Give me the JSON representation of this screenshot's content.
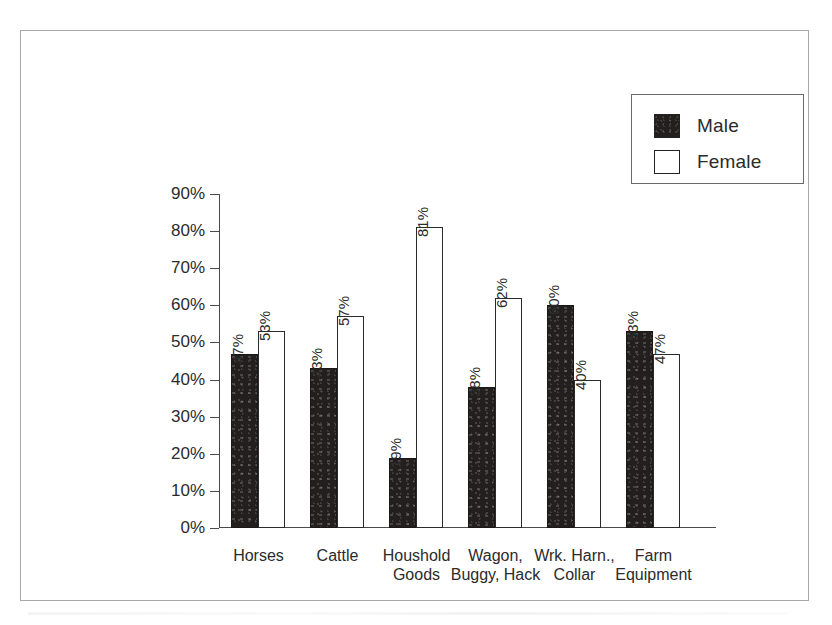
{
  "chart_data": {
    "type": "bar",
    "title": "",
    "subtitle": "",
    "xlabel": "",
    "ylabel": "",
    "ylim": [
      0,
      90
    ],
    "ytick_labels": [
      "90%",
      "80%",
      "70%",
      "60%",
      "50%",
      "40%",
      "30%",
      "20%",
      "10%",
      "0%"
    ],
    "ytick_values": [
      90,
      80,
      70,
      60,
      50,
      40,
      30,
      20,
      10,
      0
    ],
    "grid": false,
    "legend_position": "top-right",
    "categories": [
      "Horses",
      "Cattle",
      "Houshold Goods",
      "Wagon, Buggy, Hack",
      "Wrk. Harn., Collar",
      "Farm Equipment"
    ],
    "category_lines": [
      [
        "Horses"
      ],
      [
        "Cattle"
      ],
      [
        "Houshold",
        "Goods"
      ],
      [
        "Wagon,",
        "Buggy, Hack"
      ],
      [
        "Wrk. Harn.,",
        "Collar"
      ],
      [
        "Farm",
        "Equipment"
      ]
    ],
    "series": [
      {
        "name": "Male",
        "color": "#231f1f",
        "values": [
          47,
          43,
          19,
          38,
          60,
          53
        ],
        "labels": [
          "47%",
          "43%",
          "19%",
          "38%",
          "60%",
          "53%"
        ]
      },
      {
        "name": "Female",
        "color": "#ffffff",
        "values": [
          53,
          57,
          81,
          62,
          40,
          47
        ],
        "labels": [
          "53%",
          "57%",
          "81%",
          "62%",
          "40%",
          "47%"
        ]
      }
    ]
  },
  "legend": {
    "items": [
      {
        "label": "Male",
        "swatch": "filled-black"
      },
      {
        "label": "Female",
        "swatch": "outline-white"
      }
    ]
  }
}
